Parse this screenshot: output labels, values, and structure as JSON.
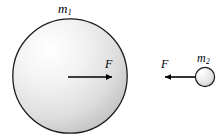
{
  "figure": {
    "background_color": "#ffffff",
    "width": 223,
    "height": 139
  },
  "labels": {
    "mass_large": {
      "symbol": "m",
      "subscript": "1",
      "text": "m1"
    },
    "mass_small": {
      "symbol": "m",
      "subscript": "2",
      "text": "m2"
    },
    "force_large": "F",
    "force_small": "F"
  },
  "diagram_data": {
    "type": "physics-free-body-diagram",
    "colors": {
      "sphere_highlight": "#fdfdfd",
      "sphere_midtone": "#e3e3e3",
      "sphere_shadow": "#c2c2c2",
      "outline": "#1a1a1a",
      "arrow": "#000000"
    },
    "objects": [
      {
        "name": "large-sphere",
        "label": "m1",
        "shape": "circle",
        "center_x": 70,
        "center_y": 76,
        "radius": 58,
        "force": {
          "label": "F",
          "direction": "right",
          "tail_x": 68,
          "tip_x": 113,
          "y": 77
        }
      },
      {
        "name": "small-sphere",
        "label": "m2",
        "shape": "circle",
        "center_x": 205,
        "center_y": 77,
        "radius": 10,
        "force": {
          "label": "F",
          "direction": "left",
          "tail_x": 195,
          "tip_x": 164,
          "y": 77
        }
      }
    ]
  }
}
